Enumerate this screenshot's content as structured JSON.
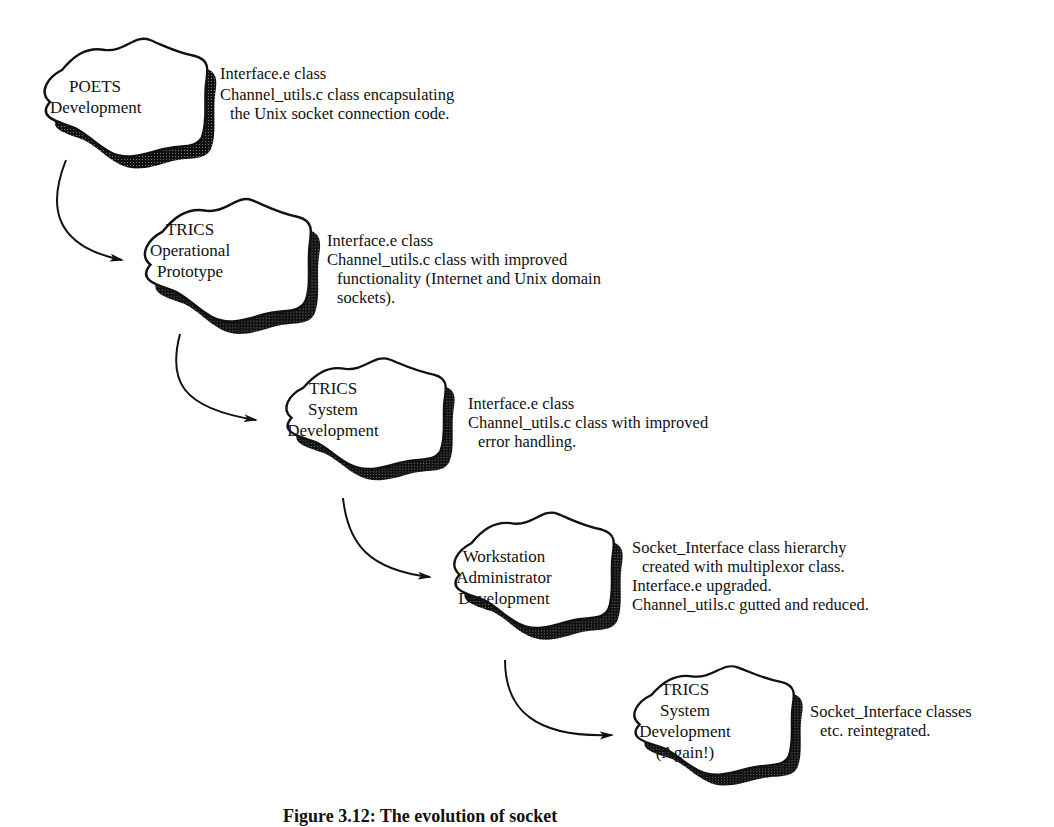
{
  "diagram": {
    "type": "evolution-flow",
    "stages": [
      {
        "id": "poets",
        "label_lines": [
          "POETS",
          "Development"
        ],
        "notes": [
          {
            "text": "Interface.e class",
            "indent": false
          },
          {
            "text": "Channel_utils.c class encapsulating",
            "indent": false
          },
          {
            "text": "the Unix socket connection code.",
            "indent": true
          }
        ]
      },
      {
        "id": "trics-op-proto",
        "label_lines": [
          "TRICS",
          "Operational",
          "Prototype"
        ],
        "notes": [
          {
            "text": "Interface.e class",
            "indent": false
          },
          {
            "text": "Channel_utils.c class with improved",
            "indent": false
          },
          {
            "text": "functionality (Internet and Unix domain",
            "indent": true
          },
          {
            "text": "sockets).",
            "indent": true
          }
        ]
      },
      {
        "id": "trics-sys-dev",
        "label_lines": [
          "TRICS",
          "System",
          "Development"
        ],
        "notes": [
          {
            "text": "Interface.e class",
            "indent": false
          },
          {
            "text": "Channel_utils.c class with improved",
            "indent": false
          },
          {
            "text": "error handling.",
            "indent": true
          }
        ]
      },
      {
        "id": "workstation-admin",
        "label_lines": [
          "Workstation",
          "Administrator",
          "Development"
        ],
        "notes": [
          {
            "text": "Socket_Interface class hierarchy",
            "indent": false
          },
          {
            "text": "created with multiplexor class.",
            "indent": true
          },
          {
            "text": "Interface.e upgraded.",
            "indent": false
          },
          {
            "text": "Channel_utils.c gutted and reduced.",
            "indent": false
          }
        ]
      },
      {
        "id": "trics-sys-dev-again",
        "label_lines": [
          "TRICS",
          "System",
          "Development",
          "(Again!)"
        ],
        "notes": [
          {
            "text": "Socket_Interface classes",
            "indent": false
          },
          {
            "text": "etc. reintegrated.",
            "indent": true
          }
        ]
      }
    ],
    "edges": [
      {
        "from": "poets",
        "to": "trics-op-proto"
      },
      {
        "from": "trics-op-proto",
        "to": "trics-sys-dev"
      },
      {
        "from": "trics-sys-dev",
        "to": "workstation-admin"
      },
      {
        "from": "workstation-admin",
        "to": "trics-sys-dev-again"
      }
    ],
    "caption": "Figure 3.12: The evolution of socket"
  }
}
